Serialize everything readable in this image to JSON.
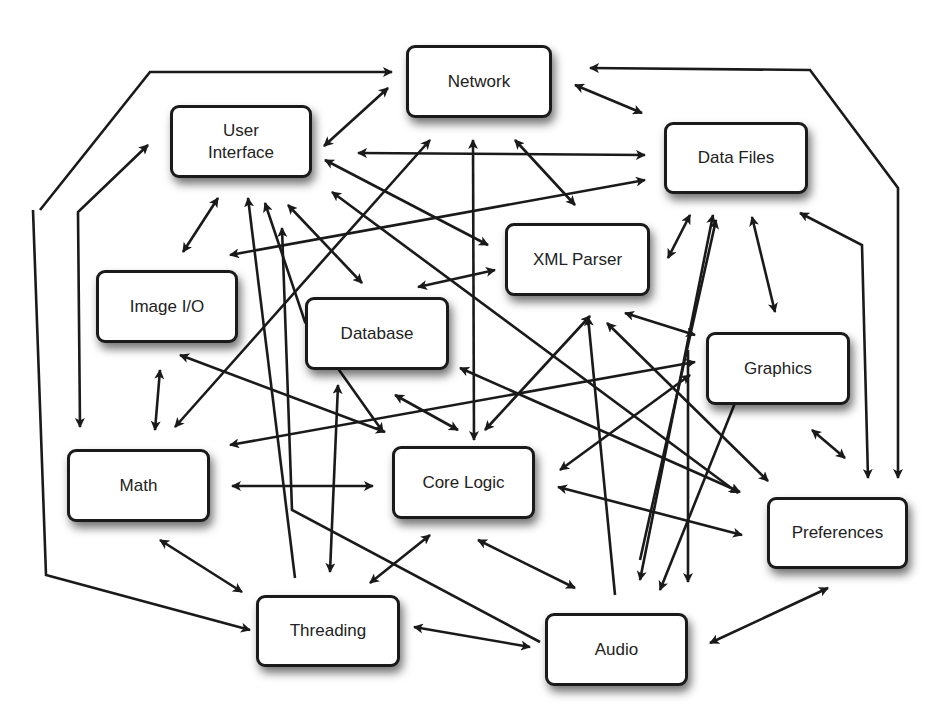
{
  "diagram": {
    "type": "dependency-graph",
    "colors": {
      "stroke": "#1a1a1a",
      "box_fill": "#ffffff",
      "text": "#222222"
    },
    "nodes": [
      {
        "id": "network",
        "label": "Network",
        "x": 406,
        "y": 45,
        "w": 146,
        "h": 73
      },
      {
        "id": "ui",
        "label": "User\nInterface",
        "x": 170,
        "y": 105,
        "w": 142,
        "h": 73
      },
      {
        "id": "datafiles",
        "label": "Data Files",
        "x": 664,
        "y": 122,
        "w": 144,
        "h": 72
      },
      {
        "id": "xml",
        "label": "XML Parser",
        "x": 505,
        "y": 223,
        "w": 145,
        "h": 73
      },
      {
        "id": "imageio",
        "label": "Image I/O",
        "x": 96,
        "y": 270,
        "w": 142,
        "h": 73
      },
      {
        "id": "database",
        "label": "Database",
        "x": 305,
        "y": 297,
        "w": 144,
        "h": 73
      },
      {
        "id": "graphics",
        "label": "Graphics",
        "x": 706,
        "y": 332,
        "w": 144,
        "h": 73
      },
      {
        "id": "math",
        "label": "Math",
        "x": 67,
        "y": 449,
        "w": 143,
        "h": 73
      },
      {
        "id": "corelogic",
        "label": "Core Logic",
        "x": 392,
        "y": 446,
        "w": 143,
        "h": 73
      },
      {
        "id": "preferences",
        "label": "Preferences",
        "x": 767,
        "y": 497,
        "w": 141,
        "h": 72
      },
      {
        "id": "threading",
        "label": "Threading",
        "x": 256,
        "y": 595,
        "w": 144,
        "h": 72
      },
      {
        "id": "audio",
        "label": "Audio",
        "x": 545,
        "y": 613,
        "w": 143,
        "h": 73
      }
    ],
    "edges": [
      {
        "points": [
          [
            40,
            210
          ],
          [
            150,
            72
          ],
          [
            392,
            72
          ]
        ],
        "start": false,
        "end": true
      },
      {
        "points": [
          [
            33,
            210
          ],
          [
            46,
            575
          ],
          [
            250,
            630
          ]
        ],
        "start": false,
        "end": true
      },
      {
        "points": [
          [
            80,
            427
          ],
          [
            78,
            212
          ],
          [
            148,
            145
          ]
        ],
        "start": true,
        "end": true
      },
      {
        "points": [
          [
            324,
            146
          ],
          [
            388,
            88
          ]
        ],
        "start": true,
        "end": true
      },
      {
        "points": [
          [
            358,
            153
          ],
          [
            645,
            155
          ]
        ],
        "start": true,
        "end": true
      },
      {
        "points": [
          [
            325,
            160
          ],
          [
            488,
            245
          ]
        ],
        "start": true,
        "end": true
      },
      {
        "points": [
          [
            332,
            192
          ],
          [
            738,
            493
          ]
        ],
        "start": true,
        "end": true
      },
      {
        "points": [
          [
            230,
            255
          ],
          [
            645,
            180
          ]
        ],
        "start": true,
        "end": true
      },
      {
        "points": [
          [
            183,
            252
          ],
          [
            218,
            198
          ]
        ],
        "start": true,
        "end": true
      },
      {
        "points": [
          [
            248,
            198
          ],
          [
            295,
            578
          ]
        ],
        "start": true,
        "end": false
      },
      {
        "points": [
          [
            265,
            203
          ],
          [
            305,
            322
          ],
          [
            383,
            432
          ]
        ],
        "start": true,
        "end": true
      },
      {
        "points": [
          [
            282,
            228
          ],
          [
            292,
            510
          ],
          [
            540,
            642
          ]
        ],
        "start": true,
        "end": false
      },
      {
        "points": [
          [
            288,
            205
          ],
          [
            362,
            283
          ]
        ],
        "start": true,
        "end": true
      },
      {
        "points": [
          [
            430,
            140
          ],
          [
            175,
            427
          ]
        ],
        "start": true,
        "end": true
      },
      {
        "points": [
          [
            473,
            140
          ],
          [
            474,
            440
          ]
        ],
        "start": true,
        "end": true
      },
      {
        "points": [
          [
            515,
            140
          ],
          [
            575,
            205
          ]
        ],
        "start": true,
        "end": true
      },
      {
        "points": [
          [
            575,
            85
          ],
          [
            642,
            113
          ]
        ],
        "start": true,
        "end": true
      },
      {
        "points": [
          [
            590,
            68
          ],
          [
            810,
            70
          ],
          [
            898,
            188
          ],
          [
            898,
            478
          ]
        ],
        "start": true,
        "end": true
      },
      {
        "points": [
          [
            418,
            287
          ],
          [
            495,
            270
          ]
        ],
        "start": true,
        "end": true
      },
      {
        "points": [
          [
            668,
            258
          ],
          [
            690,
            215
          ]
        ],
        "start": true,
        "end": true
      },
      {
        "points": [
          [
            713,
            215
          ],
          [
            640,
            580
          ]
        ],
        "start": true,
        "end": true
      },
      {
        "points": [
          [
            752,
            217
          ],
          [
            775,
            312
          ]
        ],
        "start": true,
        "end": true
      },
      {
        "points": [
          [
            800,
            213
          ],
          [
            862,
            245
          ],
          [
            868,
            478
          ]
        ],
        "start": true,
        "end": true
      },
      {
        "points": [
          [
            625,
            313
          ],
          [
            695,
            335
          ]
        ],
        "start": true,
        "end": true
      },
      {
        "points": [
          [
            590,
            316
          ],
          [
            485,
            430
          ]
        ],
        "start": true,
        "end": true
      },
      {
        "points": [
          [
            588,
            317
          ],
          [
            615,
            595
          ]
        ],
        "start": true,
        "end": false
      },
      {
        "points": [
          [
            607,
            323
          ],
          [
            768,
            481
          ]
        ],
        "start": true,
        "end": true
      },
      {
        "points": [
          [
            180,
            355
          ],
          [
            385,
            432
          ]
        ],
        "start": true,
        "end": true
      },
      {
        "points": [
          [
            160,
            370
          ],
          [
            155,
            430
          ]
        ],
        "start": true,
        "end": true
      },
      {
        "points": [
          [
            230,
            445
          ],
          [
            695,
            362
          ]
        ],
        "start": true,
        "end": true
      },
      {
        "points": [
          [
            232,
            486
          ],
          [
            373,
            486
          ]
        ],
        "start": true,
        "end": true
      },
      {
        "points": [
          [
            160,
            540
          ],
          [
            242,
            592
          ]
        ],
        "start": true,
        "end": true
      },
      {
        "points": [
          [
            338,
            385
          ],
          [
            330,
            572
          ]
        ],
        "start": true,
        "end": true
      },
      {
        "points": [
          [
            395,
            395
          ],
          [
            458,
            430
          ]
        ],
        "start": true,
        "end": true
      },
      {
        "points": [
          [
            460,
            368
          ],
          [
            740,
            492
          ]
        ],
        "start": true,
        "end": true
      },
      {
        "points": [
          [
            560,
            470
          ],
          [
            690,
            375
          ]
        ],
        "start": true,
        "end": true
      },
      {
        "points": [
          [
            558,
            487
          ],
          [
            742,
            535
          ]
        ],
        "start": true,
        "end": true
      },
      {
        "points": [
          [
            478,
            540
          ],
          [
            575,
            588
          ]
        ],
        "start": true,
        "end": true
      },
      {
        "points": [
          [
            430,
            535
          ],
          [
            370,
            583
          ]
        ],
        "start": true,
        "end": true
      },
      {
        "points": [
          [
            414,
            627
          ],
          [
            530,
            647
          ]
        ],
        "start": true,
        "end": true
      },
      {
        "points": [
          [
            660,
            590
          ],
          [
            745,
            378
          ]
        ],
        "start": true,
        "end": true
      },
      {
        "points": [
          [
            688,
            582
          ],
          [
            688,
            350
          ]
        ],
        "start": true,
        "end": false
      },
      {
        "points": [
          [
            812,
            430
          ],
          [
            845,
            458
          ]
        ],
        "start": true,
        "end": true
      },
      {
        "points": [
          [
            710,
            643
          ],
          [
            828,
            588
          ]
        ],
        "start": true,
        "end": true
      },
      {
        "points": [
          [
            640,
            560
          ],
          [
            716,
            220
          ]
        ],
        "start": false,
        "end": true
      }
    ]
  }
}
